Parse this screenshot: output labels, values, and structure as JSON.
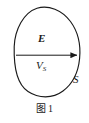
{
  "figure": {
    "caption_prefix": "图",
    "caption_number": "1",
    "background_color": "#ffffff",
    "stroke_color": "#1a1a1a",
    "labels": {
      "field_vector": "E",
      "volume_base": "V",
      "volume_subscript": "S",
      "surface": "S"
    },
    "alt": "Closed surface S enclosing volume Vs with electric field vector E arrow pointing right"
  },
  "diagram_data": {
    "type": "physics-schematic",
    "elements": [
      {
        "name": "closed-surface-curve",
        "shape": "irregular closed loop",
        "label": "S",
        "label_position": {
          "x": 75,
          "y": 79
        },
        "bounds": {
          "x_min": 12,
          "x_max": 80,
          "y_min": 7,
          "y_max": 97
        }
      },
      {
        "name": "field-vector-arrow",
        "shape": "horizontal arrow with solid triangular head",
        "label": "E",
        "label_position": {
          "x": 43,
          "y": 39
        },
        "start": {
          "x": 16,
          "y": 55
        },
        "end": {
          "x": 78,
          "y": 55
        },
        "direction": "right"
      },
      {
        "name": "enclosed-volume-label",
        "label": "Vs",
        "label_position": {
          "x": 41,
          "y": 66
        }
      }
    ]
  }
}
